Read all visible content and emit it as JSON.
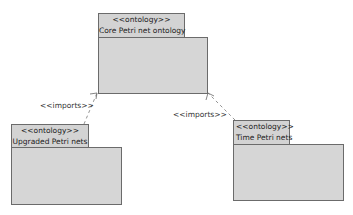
{
  "packages": {
    "core": {
      "stereotype": "<<ontology>>",
      "name": "Core Petri net ontology"
    },
    "upgraded": {
      "stereotype": "<<ontology>>",
      "name": "Upgraded Petri nets"
    },
    "time": {
      "stereotype": "<<ontology>>",
      "name": "Time Petri nets"
    }
  },
  "relations": [
    {
      "label": "<<imports>>",
      "from": "Upgraded Petri nets",
      "to": "Core Petri net ontology"
    },
    {
      "label": "<<imports>>",
      "from": "Time Petri nets",
      "to": "Core Petri net ontology"
    }
  ],
  "colors": {
    "fill": "#d6d6d6",
    "border": "#6b6b6b"
  }
}
